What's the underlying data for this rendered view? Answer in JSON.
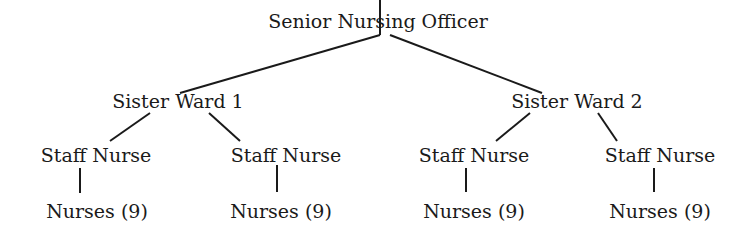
{
  "diagram": {
    "type": "organization-chart",
    "root": {
      "label": "Senior Nursing Officer"
    },
    "level1": [
      {
        "label": "Sister Ward 1"
      },
      {
        "label": "Sister Ward 2"
      }
    ],
    "level2": [
      {
        "label": "Staff Nurse",
        "parent": 0
      },
      {
        "label": "Staff Nurse",
        "parent": 0
      },
      {
        "label": "Staff Nurse",
        "parent": 1
      },
      {
        "label": "Staff Nurse",
        "parent": 1
      }
    ],
    "level3": [
      {
        "label": "Nurses (9)",
        "parent": 0
      },
      {
        "label": "Nurses (9)",
        "parent": 1
      },
      {
        "label": "Nurses (9)",
        "parent": 2
      },
      {
        "label": "Nurses (9)",
        "parent": 3
      }
    ]
  }
}
